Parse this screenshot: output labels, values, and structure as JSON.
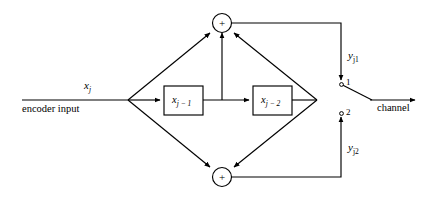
{
  "figure": {
    "type": "block-diagram",
    "background_color": "#ffffff",
    "line_color": "#000000"
  },
  "input": {
    "signal_label": "x",
    "signal_subscript": "j",
    "caption": "encoder input"
  },
  "registers": [
    {
      "name": "delay-stage-1",
      "base": "x",
      "subscript": "j − 1"
    },
    {
      "name": "delay-stage-2",
      "base": "x",
      "subscript": "j − 2"
    }
  ],
  "adders": [
    {
      "name": "modulo-2-adder-top",
      "symbol": "+",
      "inputs": 3
    },
    {
      "name": "modulo-2-adder-bottom",
      "symbol": "+",
      "inputs": 2
    }
  ],
  "outputs": [
    {
      "name": "output-path-1",
      "base": "y",
      "subscript": "j1",
      "terminal": "1"
    },
    {
      "name": "output-path-2",
      "base": "y",
      "subscript": "j2",
      "terminal": "2"
    }
  ],
  "switch": {
    "name": "output-commutator-switch",
    "terminal_top": "1",
    "terminal_bottom": "2",
    "selected": "1"
  },
  "channel": {
    "caption": "channel"
  }
}
